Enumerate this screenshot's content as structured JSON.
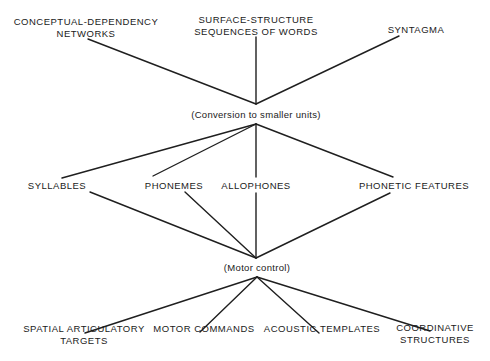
{
  "diagram": {
    "top_nodes": [
      {
        "id": "conceptual-dependency",
        "lines": [
          "CONCEPTUAL-DEPENDENCY",
          "NETWORKS"
        ]
      },
      {
        "id": "surface-structure",
        "lines": [
          "SURFACE-STRUCTURE",
          "SEQUENCES OF WORDS"
        ]
      },
      {
        "id": "syntagma",
        "lines": [
          "SYNTAGMA"
        ]
      }
    ],
    "process_1": "(Conversion to smaller units)",
    "middle_nodes": [
      {
        "id": "syllables",
        "label": "SYLLABLES"
      },
      {
        "id": "phonemes",
        "label": "PHONEMES"
      },
      {
        "id": "allophones",
        "label": "ALLOPHONES"
      },
      {
        "id": "phonetic-features",
        "label": "PHONETIC FEATURES"
      }
    ],
    "process_2": "(Motor control)",
    "bottom_nodes": [
      {
        "id": "spatial-articulatory-targets",
        "lines": [
          "SPATIAL ARTICULATORY",
          "TARGETS"
        ]
      },
      {
        "id": "motor-commands",
        "lines": [
          "MOTOR COMMANDS"
        ]
      },
      {
        "id": "acoustic-templates",
        "lines": [
          "ACOUSTIC TEMPLATES"
        ]
      },
      {
        "id": "coordinative-structures",
        "lines": [
          "COORDINATIVE",
          "STRUCTURES"
        ]
      }
    ],
    "edges": [
      {
        "from": "conceptual-dependency",
        "to": "process_1"
      },
      {
        "from": "surface-structure",
        "to": "process_1"
      },
      {
        "from": "syntagma",
        "to": "process_1"
      },
      {
        "from": "process_1",
        "to": "syllables"
      },
      {
        "from": "process_1",
        "to": "phonemes"
      },
      {
        "from": "process_1",
        "to": "allophones"
      },
      {
        "from": "process_1",
        "to": "phonetic-features"
      },
      {
        "from": "syllables",
        "to": "process_2"
      },
      {
        "from": "phonemes",
        "to": "process_2"
      },
      {
        "from": "allophones",
        "to": "process_2"
      },
      {
        "from": "phonetic-features",
        "to": "process_2"
      },
      {
        "from": "process_2",
        "to": "spatial-articulatory-targets"
      },
      {
        "from": "process_2",
        "to": "motor-commands"
      },
      {
        "from": "process_2",
        "to": "acoustic-templates"
      },
      {
        "from": "process_2",
        "to": "coordinative-structures"
      }
    ]
  }
}
